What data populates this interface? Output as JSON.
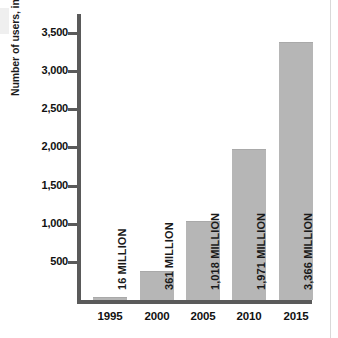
{
  "chart_data": {
    "type": "bar",
    "title": "",
    "subtitle": "",
    "xlabel": "",
    "ylabel": "Number of users, in millions",
    "categories": [
      "1995",
      "2000",
      "2005",
      "2010",
      "2015"
    ],
    "values": [
      16,
      361,
      1018,
      1971,
      3366
    ],
    "data_labels": [
      "16 MILLION",
      "361 MILLION",
      "1,018 MILLION",
      "1,971 MILLION",
      "3,366 MILLION"
    ],
    "ylim": [
      0,
      3750
    ],
    "yticks": [
      500,
      1000,
      1500,
      2000,
      2500,
      3000,
      3500
    ],
    "ytick_labels": [
      "500",
      "1,000",
      "1,500",
      "2,000",
      "2,500",
      "3,000",
      "3,500"
    ],
    "grid": false,
    "legend": null,
    "series": [
      {
        "name": "Number of users",
        "values": [
          16,
          361,
          1018,
          1971,
          3366
        ]
      }
    ],
    "colors": {
      "bar_fill": "#b6b6b6",
      "axis": "#5a5a5a",
      "text": "#111111",
      "background": "#ffffff"
    }
  }
}
